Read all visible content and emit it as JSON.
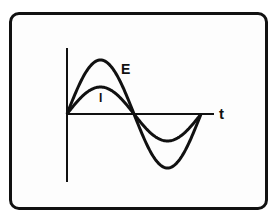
{
  "diagram": {
    "title": "",
    "axis_label_x": "t",
    "series": [
      {
        "name": "E",
        "label": "E",
        "amplitude_ratio": 2,
        "phase_deg": 0
      },
      {
        "name": "I",
        "label": "I",
        "amplitude_ratio": 1,
        "phase_deg": 0
      }
    ],
    "colors": {
      "stroke": "#111111",
      "background": "#ffffff"
    }
  },
  "labels": {
    "e": "E",
    "i": "I",
    "t": "t"
  }
}
